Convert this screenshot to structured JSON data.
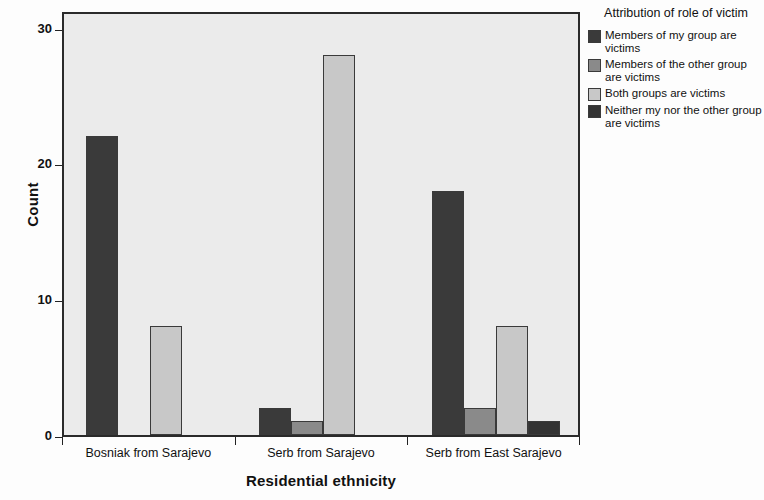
{
  "chart_data": {
    "type": "bar",
    "title": "",
    "subtitle": "",
    "xlabel": "Residential ethnicity",
    "ylabel": "Count",
    "categories": [
      "Bosniak from Sarajevo",
      "Serb from Sarajevo",
      "Serb from East Sarajevo"
    ],
    "series": [
      {
        "name": "Members of my group are victims",
        "values": [
          22,
          2,
          18
        ],
        "color": "#3a3a3a"
      },
      {
        "name": "Members of the other group are victims",
        "values": [
          0,
          1,
          2
        ],
        "color": "#8a8a8a"
      },
      {
        "name": "Both groups are victims",
        "values": [
          8,
          28,
          8
        ],
        "color": "#c8c8c8"
      },
      {
        "name": "Neither my nor the other group are victims",
        "values": [
          0,
          0,
          1
        ],
        "color": "#333333"
      }
    ],
    "ylim": [
      0,
      31.3
    ],
    "yticks": [
      0,
      10,
      20,
      30
    ],
    "ytick_labels": [
      "0",
      "10",
      "20",
      "30"
    ],
    "grid": false,
    "legend_position": "right",
    "legend_title": "Attribution of role of victim"
  },
  "legend": {
    "title": "Attribution of role of victim",
    "items": [
      {
        "label": "Members of my group are victims",
        "color": "#3a3a3a"
      },
      {
        "label": "Members of the other group are victims",
        "color": "#8a8a8a"
      },
      {
        "label": "Both groups are victims",
        "color": "#c8c8c8"
      },
      {
        "label": "Neither my nor the other group are victims",
        "color": "#333333"
      }
    ]
  },
  "axes": {
    "y_title": "Count",
    "x_title": "Residential ethnicity"
  }
}
